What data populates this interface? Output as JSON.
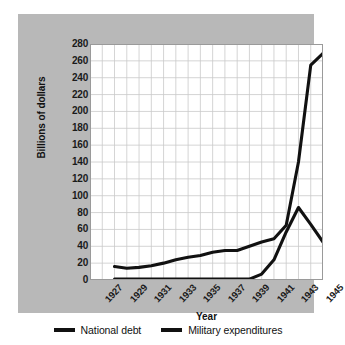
{
  "chart_data": {
    "type": "line",
    "title": "",
    "xlabel": "Year",
    "ylabel": "Billions of dollars",
    "xlim": [
      1927,
      1946
    ],
    "ylim": [
      0,
      280
    ],
    "grid": true,
    "legend_position": "bottom",
    "x_tick_labels": [
      "1927",
      "1929",
      "1931",
      "1933",
      "1935",
      "1937",
      "1939",
      "1941",
      "1943",
      "1945"
    ],
    "x_tick_values": [
      1927,
      1929,
      1931,
      1933,
      1935,
      1937,
      1939,
      1941,
      1943,
      1945
    ],
    "y_tick_labels": [
      "280",
      "260",
      "240",
      "220",
      "200",
      "180",
      "160",
      "140",
      "120",
      "100",
      "80",
      "60",
      "40",
      "20",
      "0"
    ],
    "y_tick_values": [
      280,
      260,
      240,
      220,
      200,
      180,
      160,
      140,
      120,
      100,
      80,
      60,
      40,
      20,
      0
    ],
    "x": [
      1929,
      1930,
      1931,
      1932,
      1933,
      1934,
      1935,
      1936,
      1937,
      1938,
      1939,
      1940,
      1941,
      1942,
      1943,
      1944,
      1945,
      1946
    ],
    "series": [
      {
        "name": "National debt",
        "color": "#111111",
        "values": [
          16,
          14,
          15,
          17,
          20,
          24,
          27,
          29,
          33,
          35,
          35,
          40,
          45,
          49,
          65,
          140,
          255,
          269
        ]
      },
      {
        "name": "Military expenditures",
        "color": "#111111",
        "values": [
          1,
          1,
          1,
          1,
          1,
          1,
          1,
          1,
          1,
          1,
          1,
          1,
          7,
          24,
          57,
          86,
          66,
          45
        ]
      }
    ]
  },
  "legend": {
    "entries": [
      {
        "label": "National debt"
      },
      {
        "label": "Military expenditures"
      }
    ]
  },
  "colors": {
    "panel_background": "#b8b8b8",
    "plot_background": "#ffffff",
    "grid": "#c9c9c9",
    "line": "#111111",
    "text": "#111111"
  }
}
